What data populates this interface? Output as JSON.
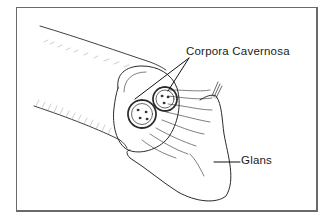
{
  "diagram": {
    "type": "anatomical-illustration",
    "labels": [
      {
        "id": "corpora",
        "text": "Corpora Cavernosa",
        "pointers": 2
      },
      {
        "id": "glans",
        "text": "Glans",
        "pointers": 1
      }
    ],
    "cross_section_numbers": [
      "1",
      "2"
    ],
    "colors": {
      "line": "#2a2a2a",
      "border": "#6a6a6a",
      "background": "#ffffff"
    }
  }
}
